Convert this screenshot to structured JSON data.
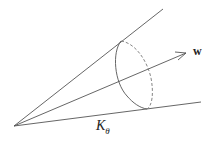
{
  "diagram": {
    "type": "cone",
    "apex": [
      14,
      126
    ],
    "upper_edge_end": [
      163,
      9
    ],
    "lower_edge_end": [
      201,
      102
    ],
    "axis_vector": {
      "label": "w",
      "from": [
        14,
        126
      ],
      "to": [
        186,
        53
      ]
    },
    "cross_section": {
      "center": [
        134,
        75
      ],
      "rx": 18,
      "ry": 35,
      "front_style": "solid",
      "back_style": "dashed"
    },
    "cone_label": {
      "base": "K",
      "subscript": "θ"
    },
    "stroke_color": "#555555"
  }
}
